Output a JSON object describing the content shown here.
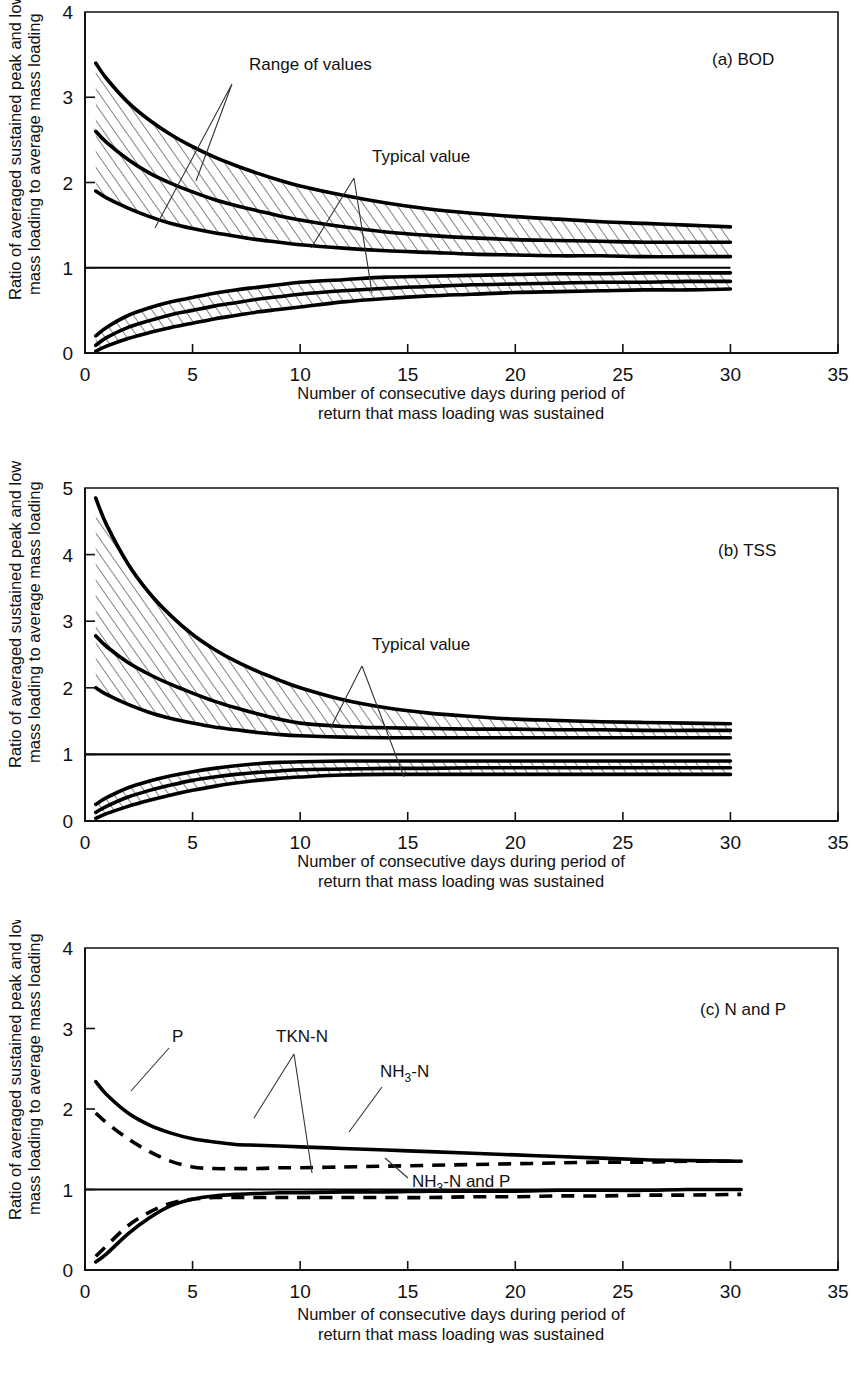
{
  "figure": {
    "y_axis_label_line1": "Ratio of averaged sustained peak and low",
    "y_axis_label_line2": "mass loading to average mass loading",
    "x_axis_caption_line1": "Number of consecutive days during period of",
    "x_axis_caption_line2": "return that mass loading was sustained",
    "ink_color": "#000000"
  },
  "panels": [
    {
      "id": "a",
      "tag": "(a) BOD",
      "annotations": [
        "Range of values",
        "Typical value"
      ]
    },
    {
      "id": "b",
      "tag": "(b) TSS",
      "annotations": [
        "Typical value"
      ]
    },
    {
      "id": "c",
      "tag": "(c) N and P",
      "annotations": [
        "P",
        "TKN-N",
        "NH",
        "3",
        "-N",
        "NH",
        "3",
        "-N and P"
      ]
    }
  ],
  "labels": {
    "range_of_values": "Range of values",
    "typical_value": "Typical value",
    "p": "P",
    "tkn_n": "TKN-N",
    "nh3_n_base": "NH",
    "nh3_sub": "3",
    "nh3_n_tail": "-N",
    "nh3_n_and_p_tail": "-N and P",
    "panel_a_tag": "(a) BOD",
    "panel_b_tag": "(b) TSS",
    "panel_c_tag": "(c) N and P"
  },
  "ticks": {
    "x": [
      "0",
      "5",
      "10",
      "15",
      "20",
      "25",
      "30",
      "35"
    ],
    "x_values": [
      0,
      5,
      10,
      15,
      20,
      25,
      30,
      35
    ],
    "y_0_4": [
      "0",
      "1",
      "2",
      "3",
      "4"
    ],
    "y_0_4_values": [
      0,
      1,
      2,
      3,
      4
    ],
    "y_0_5": [
      "0",
      "1",
      "2",
      "3",
      "4",
      "5"
    ],
    "y_0_5_values": [
      0,
      1,
      2,
      3,
      4,
      5
    ]
  },
  "chart_data": [
    {
      "type": "line",
      "id": "a",
      "title": "(a) BOD",
      "xlabel": "Number of consecutive days during period of return that mass loading was sustained",
      "ylabel": "Ratio of averaged sustained peak and low mass loading to average mass loading",
      "xlim": [
        0,
        35
      ],
      "ylim": [
        0,
        4
      ],
      "xticks": [
        0,
        5,
        10,
        15,
        20,
        25,
        30,
        35
      ],
      "yticks": [
        0,
        1,
        2,
        3,
        4
      ],
      "grid": false,
      "legend": "none",
      "x": [
        0.5,
        1,
        2,
        3,
        4,
        5,
        6,
        7,
        8,
        9,
        10,
        12,
        14,
        16,
        18,
        20,
        22,
        24,
        26,
        28,
        30
      ],
      "series": [
        {
          "name": "Peak typical value",
          "style": "solid",
          "values": [
            2.6,
            2.47,
            2.27,
            2.11,
            1.99,
            1.89,
            1.8,
            1.73,
            1.67,
            1.61,
            1.56,
            1.48,
            1.42,
            1.38,
            1.35,
            1.33,
            1.32,
            1.31,
            1.3,
            1.3,
            1.3
          ]
        },
        {
          "name": "Peak range upper",
          "style": "hatch-edge",
          "values": [
            3.4,
            3.22,
            2.94,
            2.73,
            2.56,
            2.42,
            2.3,
            2.2,
            2.11,
            2.03,
            1.96,
            1.85,
            1.76,
            1.69,
            1.64,
            1.6,
            1.57,
            1.54,
            1.52,
            1.5,
            1.48
          ]
        },
        {
          "name": "Peak range lower",
          "style": "hatch-edge",
          "values": [
            1.9,
            1.82,
            1.7,
            1.6,
            1.52,
            1.46,
            1.41,
            1.37,
            1.33,
            1.3,
            1.27,
            1.23,
            1.2,
            1.18,
            1.16,
            1.15,
            1.14,
            1.14,
            1.13,
            1.13,
            1.13
          ]
        },
        {
          "name": "Low typical value",
          "style": "solid",
          "values": [
            0.09,
            0.18,
            0.3,
            0.38,
            0.45,
            0.5,
            0.55,
            0.59,
            0.63,
            0.66,
            0.69,
            0.73,
            0.76,
            0.78,
            0.8,
            0.81,
            0.82,
            0.83,
            0.83,
            0.84,
            0.84
          ]
        },
        {
          "name": "Low range upper",
          "style": "hatch-edge",
          "values": [
            0.2,
            0.3,
            0.44,
            0.53,
            0.6,
            0.65,
            0.7,
            0.74,
            0.77,
            0.8,
            0.83,
            0.86,
            0.89,
            0.9,
            0.91,
            0.92,
            0.93,
            0.93,
            0.94,
            0.94,
            0.94
          ]
        },
        {
          "name": "Low range lower",
          "style": "hatch-edge",
          "values": [
            0.02,
            0.08,
            0.17,
            0.24,
            0.3,
            0.35,
            0.4,
            0.44,
            0.48,
            0.51,
            0.54,
            0.6,
            0.64,
            0.67,
            0.69,
            0.71,
            0.72,
            0.73,
            0.74,
            0.74,
            0.75
          ]
        },
        {
          "name": "Unity reference",
          "style": "solid-thin",
          "values": [
            1,
            1,
            1,
            1,
            1,
            1,
            1,
            1,
            1,
            1,
            1,
            1,
            1,
            1,
            1,
            1,
            1,
            1,
            1,
            1,
            1
          ]
        }
      ]
    },
    {
      "type": "line",
      "id": "b",
      "title": "(b) TSS",
      "xlabel": "Number of consecutive days during period of return that mass loading was sustained",
      "ylabel": "Ratio of averaged sustained peak and low mass loading to average mass loading",
      "xlim": [
        0,
        35
      ],
      "ylim": [
        0,
        5
      ],
      "xticks": [
        0,
        5,
        10,
        15,
        20,
        25,
        30,
        35
      ],
      "yticks": [
        0,
        1,
        2,
        3,
        4,
        5
      ],
      "grid": false,
      "legend": "none",
      "x": [
        0.5,
        1,
        2,
        3,
        4,
        5,
        6,
        7,
        8,
        9,
        10,
        12,
        14,
        16,
        18,
        20,
        22,
        24,
        26,
        28,
        30
      ],
      "series": [
        {
          "name": "Peak typical value",
          "style": "solid",
          "values": [
            2.78,
            2.62,
            2.38,
            2.2,
            2.05,
            1.92,
            1.8,
            1.7,
            1.61,
            1.53,
            1.47,
            1.42,
            1.4,
            1.39,
            1.38,
            1.38,
            1.37,
            1.37,
            1.36,
            1.36,
            1.36
          ]
        },
        {
          "name": "Peak range upper",
          "style": "hatch-edge",
          "values": [
            4.85,
            4.45,
            3.86,
            3.42,
            3.08,
            2.8,
            2.58,
            2.4,
            2.25,
            2.12,
            2.0,
            1.82,
            1.7,
            1.62,
            1.57,
            1.53,
            1.51,
            1.49,
            1.48,
            1.47,
            1.46
          ]
        },
        {
          "name": "Peak range lower",
          "style": "hatch-edge",
          "values": [
            2.0,
            1.9,
            1.75,
            1.63,
            1.54,
            1.47,
            1.41,
            1.37,
            1.33,
            1.3,
            1.28,
            1.26,
            1.25,
            1.25,
            1.25,
            1.25,
            1.25,
            1.25,
            1.25,
            1.25,
            1.25
          ]
        },
        {
          "name": "Low typical value",
          "style": "solid",
          "values": [
            0.13,
            0.22,
            0.36,
            0.46,
            0.54,
            0.61,
            0.66,
            0.7,
            0.73,
            0.75,
            0.77,
            0.78,
            0.79,
            0.79,
            0.8,
            0.8,
            0.8,
            0.8,
            0.8,
            0.8,
            0.8
          ]
        },
        {
          "name": "Low range upper",
          "style": "hatch-edge",
          "values": [
            0.25,
            0.35,
            0.5,
            0.6,
            0.68,
            0.74,
            0.79,
            0.83,
            0.86,
            0.88,
            0.89,
            0.9,
            0.9,
            0.9,
            0.9,
            0.9,
            0.9,
            0.9,
            0.9,
            0.9,
            0.9
          ]
        },
        {
          "name": "Low range lower",
          "style": "hatch-edge",
          "values": [
            0.04,
            0.11,
            0.22,
            0.31,
            0.39,
            0.46,
            0.52,
            0.57,
            0.61,
            0.64,
            0.66,
            0.69,
            0.7,
            0.7,
            0.7,
            0.7,
            0.7,
            0.7,
            0.7,
            0.7,
            0.7
          ]
        },
        {
          "name": "Unity reference",
          "style": "solid-thin",
          "values": [
            1,
            1,
            1,
            1,
            1,
            1,
            1,
            1,
            1,
            1,
            1,
            1,
            1,
            1,
            1,
            1,
            1,
            1,
            1,
            1,
            1
          ]
        }
      ]
    },
    {
      "type": "line",
      "id": "c",
      "title": "(c) N and P",
      "xlabel": "Number of consecutive days during period of return that mass loading was sustained",
      "ylabel": "Ratio of averaged sustained peak and low mass loading to average mass loading",
      "xlim": [
        0,
        35
      ],
      "ylim": [
        0,
        4
      ],
      "xticks": [
        0,
        5,
        10,
        15,
        20,
        25,
        30,
        35
      ],
      "yticks": [
        0,
        1,
        2,
        3,
        4
      ],
      "grid": false,
      "legend": "none",
      "x": [
        0.5,
        1,
        2,
        3,
        4,
        5,
        6,
        7,
        8,
        9,
        10,
        12,
        14,
        16,
        18,
        20,
        22,
        24,
        26,
        28,
        30.5
      ],
      "series": [
        {
          "name": "TKN-N peak",
          "style": "solid",
          "values": [
            2.34,
            2.18,
            1.95,
            1.8,
            1.7,
            1.63,
            1.59,
            1.56,
            1.55,
            1.54,
            1.53,
            1.51,
            1.49,
            1.47,
            1.45,
            1.43,
            1.41,
            1.39,
            1.37,
            1.36,
            1.35
          ]
        },
        {
          "name": "NH3-N peak",
          "style": "dashed",
          "values": [
            1.95,
            1.83,
            1.63,
            1.47,
            1.35,
            1.28,
            1.26,
            1.26,
            1.26,
            1.27,
            1.27,
            1.28,
            1.29,
            1.3,
            1.31,
            1.32,
            1.33,
            1.34,
            1.34,
            1.35,
            1.35
          ]
        },
        {
          "name": "P and TKN-N low",
          "style": "solid",
          "values": [
            0.1,
            0.2,
            0.45,
            0.65,
            0.8,
            0.88,
            0.92,
            0.94,
            0.95,
            0.96,
            0.96,
            0.97,
            0.97,
            0.98,
            0.98,
            0.98,
            0.99,
            0.99,
            0.99,
            1.0,
            1.0
          ]
        },
        {
          "name": "NH3-N and P low",
          "style": "dashed",
          "values": [
            0.17,
            0.3,
            0.55,
            0.72,
            0.83,
            0.88,
            0.9,
            0.9,
            0.9,
            0.9,
            0.9,
            0.9,
            0.9,
            0.9,
            0.91,
            0.91,
            0.92,
            0.92,
            0.93,
            0.93,
            0.94
          ]
        },
        {
          "name": "Unity reference",
          "style": "solid-thin",
          "values": [
            1,
            1,
            1,
            1,
            1,
            1,
            1,
            1,
            1,
            1,
            1,
            1,
            1,
            1,
            1,
            1,
            1,
            1,
            1,
            1,
            1
          ]
        }
      ]
    }
  ]
}
